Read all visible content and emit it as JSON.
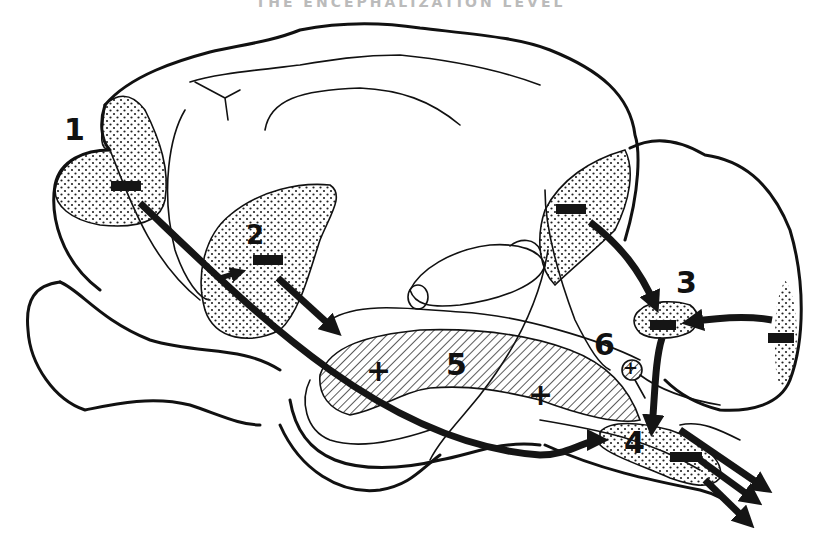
{
  "figure": {
    "caption": "THE ENCEPHALIZATION LEVEL"
  },
  "regions": [
    {
      "id": "1",
      "label": "1",
      "sign": "−",
      "pattern": "dotted",
      "location": "frontal cortex"
    },
    {
      "id": "2",
      "label": "2",
      "sign": "−",
      "pattern": "dotted",
      "location": "temporal / mid cortex"
    },
    {
      "id": "3",
      "label": "3",
      "sign": "−",
      "pattern": "dotted",
      "location": "cerebellar nucleus"
    },
    {
      "id": "4",
      "label": "4",
      "sign": "−",
      "pattern": "dotted",
      "location": "brainstem / medulla"
    },
    {
      "id": "5",
      "label": "5",
      "sign_left": "+",
      "sign_right": "+",
      "pattern": "hatched",
      "location": "brainstem reticular region"
    },
    {
      "id": "6",
      "label": "6",
      "sign": "+",
      "pattern": "hatched",
      "location": "small nucleus"
    }
  ],
  "extra_signs": {
    "occipital": "−",
    "cerebellar_cortex": "−"
  },
  "colors": {
    "ink": "#111111",
    "background": "#ffffff"
  }
}
